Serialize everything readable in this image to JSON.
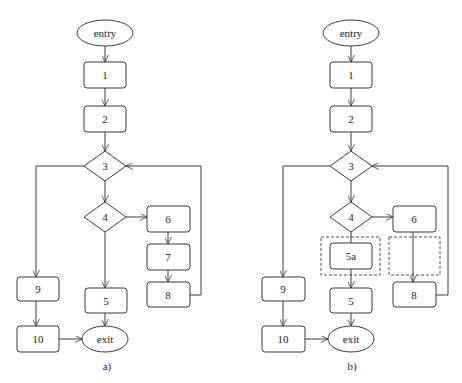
{
  "panels": [
    {
      "caption": "a)",
      "nodes": {
        "entry": "entry",
        "n1": "1",
        "n2": "2",
        "n3": "3",
        "n4": "4",
        "n5": "5",
        "n6": "6",
        "n7": "7",
        "n8": "8",
        "n9": "9",
        "n10": "10",
        "exit": "exit"
      },
      "edges": [
        [
          "entry",
          "1"
        ],
        [
          "1",
          "2"
        ],
        [
          "2",
          "3"
        ],
        [
          "3",
          "4"
        ],
        [
          "3",
          "9"
        ],
        [
          "4",
          "5"
        ],
        [
          "4",
          "6"
        ],
        [
          "6",
          "7"
        ],
        [
          "7",
          "8"
        ],
        [
          "8",
          "3"
        ],
        [
          "9",
          "10"
        ],
        [
          "10",
          "exit"
        ],
        [
          "5",
          "exit"
        ]
      ]
    },
    {
      "caption": "b)",
      "nodes": {
        "entry": "entry",
        "n1": "1",
        "n2": "2",
        "n3": "3",
        "n4": "4",
        "n5a": "5a",
        "n5": "5",
        "n6": "6",
        "n8": "8",
        "n9": "9",
        "n10": "10",
        "exit": "exit"
      },
      "dashed_groups": [
        "group around 5a",
        "empty group between 6 and 8"
      ],
      "edges": [
        [
          "entry",
          "1"
        ],
        [
          "1",
          "2"
        ],
        [
          "2",
          "3"
        ],
        [
          "3",
          "4"
        ],
        [
          "3",
          "9"
        ],
        [
          "4",
          "5a"
        ],
        [
          "5a",
          "5"
        ],
        [
          "4",
          "6"
        ],
        [
          "6",
          "8"
        ],
        [
          "8",
          "3"
        ],
        [
          "9",
          "10"
        ],
        [
          "10",
          "exit"
        ],
        [
          "5",
          "exit"
        ]
      ]
    }
  ],
  "colors": {
    "stroke": "#3a3a3a",
    "background": "#ffffff",
    "text": "#222222"
  }
}
